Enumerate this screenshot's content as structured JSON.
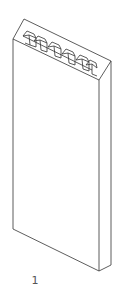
{
  "figure": {
    "label": "1",
    "line_color": "#333333",
    "background": "#ffffff"
  }
}
